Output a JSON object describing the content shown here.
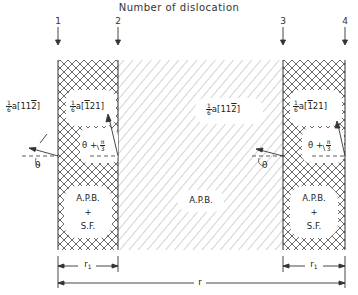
{
  "diagram": {
    "title": "Number of dislocation",
    "dislocation_numbers": [
      "1",
      "2",
      "3",
      "4"
    ],
    "regions": [
      {
        "id": "left",
        "pattern": "cross-hatch",
        "label_line1": "A.P.B.",
        "label_plus": "+",
        "label_line2": "S.F."
      },
      {
        "id": "middle",
        "pattern": "diagonal-hatch",
        "label": "A.P.B."
      },
      {
        "id": "right",
        "pattern": "cross-hatch",
        "label_line1": "A.P.B.",
        "label_plus": "+",
        "label_line2": "S.F."
      }
    ],
    "burgers_vectors": {
      "outer_left": {
        "coef_num": "1",
        "coef_den": "6",
        "a": "a",
        "open": "[",
        "idx": [
          "1",
          "1",
          "2"
        ],
        "bar": [
          false,
          false,
          true
        ],
        "close": "]"
      },
      "left_inner": {
        "coef_num": "1",
        "coef_den": "6",
        "a": "a",
        "open": "[",
        "idx": [
          "1",
          "2",
          "1"
        ],
        "bar": [
          true,
          false,
          false
        ],
        "close": "]"
      },
      "middle_right": {
        "coef_num": "1",
        "coef_den": "6",
        "a": "a",
        "open": "[",
        "idx": [
          "1",
          "1",
          "2"
        ],
        "bar": [
          false,
          false,
          true
        ],
        "close": "]"
      },
      "right_inner": {
        "coef_num": "1",
        "coef_den": "6",
        "a": "a",
        "open": "[",
        "idx": [
          "1",
          "2",
          "1"
        ],
        "bar": [
          true,
          false,
          false
        ],
        "close": "]"
      }
    },
    "angles": {
      "theta": "θ",
      "theta_plus_prefix": "θ +",
      "pi_num": "π",
      "pi_den": "3"
    },
    "dimensions": {
      "r1_left": "r",
      "r1_left_sub": "1",
      "r_total": "r",
      "r1_right": "r",
      "r1_right_sub": "1"
    },
    "colors": {
      "line": "#333333",
      "hatch": "#9a9a9a",
      "background": "#ffffff"
    }
  }
}
